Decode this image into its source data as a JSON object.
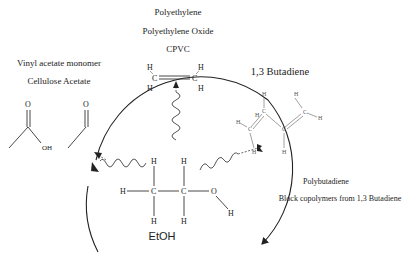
{
  "diagram": {
    "center": {
      "name": "EtOH",
      "atoms": {
        "h": "H",
        "c": "C",
        "o": "O"
      }
    },
    "top": {
      "labels": [
        "Polyethylene",
        "Polyethylene Oxide",
        "CPVC"
      ],
      "molecule": "ethylene",
      "atoms": {
        "h": "H",
        "c": "C"
      }
    },
    "left": {
      "labels": [
        "Vinyl acetate monomer",
        "Cellulose Acetate"
      ],
      "molecules": [
        "acetic acid",
        "acetaldehyde"
      ],
      "atoms": {
        "o": "O",
        "oh": "OH"
      }
    },
    "right": {
      "title": "1,3 Butadiene",
      "labels": [
        "Polybutadiene",
        "Block copolymers from 1,3 Butadiene"
      ],
      "atoms": {
        "h": "H",
        "c": "C"
      }
    },
    "colors": {
      "line": "#222222",
      "background": "#ffffff"
    }
  }
}
